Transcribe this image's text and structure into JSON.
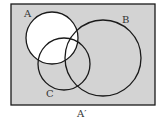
{
  "diagram": {
    "type": "venn",
    "title": "",
    "universal_set": {
      "x": 11,
      "y": 4,
      "width": 144,
      "height": 101
    },
    "sets": [
      {
        "name": "A",
        "label": "A",
        "cx": 52,
        "cy": 38,
        "r": 26,
        "label_x": 24,
        "label_y": 17
      },
      {
        "name": "B",
        "label": "B",
        "cx": 103,
        "cy": 58,
        "r": 38,
        "label_x": 122,
        "label_y": 23
      },
      {
        "name": "C",
        "label": "C",
        "cx": 64,
        "cy": 64,
        "r": 26,
        "label_x": 46,
        "label_y": 97
      }
    ],
    "shaded_region": "A'",
    "caption": "A′",
    "colors": {
      "shade": "#d3d3d3",
      "unshaded": "#ffffff",
      "stroke": "#1a1a1a"
    }
  }
}
